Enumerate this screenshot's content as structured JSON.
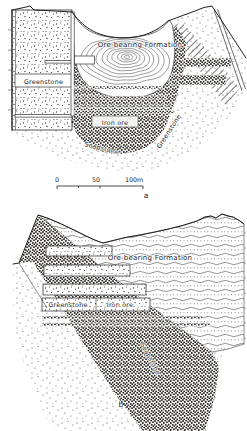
{
  "figure": {
    "ink": "#222222",
    "paper": "#ffffff",
    "panel_a": {
      "caption": "a",
      "labels": {
        "formation": "Ore-bearing Formation",
        "greenstone_left": "Greenstone",
        "iron_ore": "Iron ore",
        "soapstone": "Soapstone",
        "greenstone_right": "Greenstone"
      },
      "scale_bar": {
        "zero": "0",
        "fifty": "50",
        "hundred": "100m"
      }
    },
    "panel_b": {
      "caption": "b",
      "labels": {
        "formation": "Ore-bearing Formation",
        "greenstone": "Greenstone",
        "iron_ore": "Iron ore",
        "soapstone": "Soapstone"
      }
    }
  }
}
